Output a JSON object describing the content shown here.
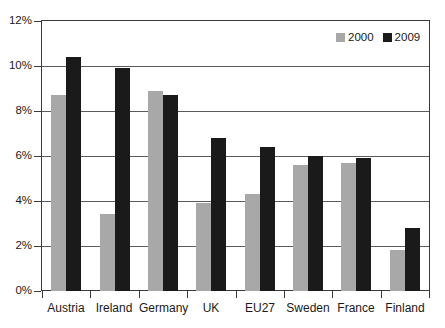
{
  "chart_data": {
    "type": "bar",
    "title": "",
    "xlabel": "",
    "ylabel": "",
    "categories": [
      "Austria",
      "Ireland",
      "Germany",
      "UK",
      "EU27",
      "Sweden",
      "France",
      "Finland"
    ],
    "series": [
      {
        "name": "2000",
        "color": "#a8a8a8",
        "values": [
          8.7,
          3.4,
          8.9,
          3.9,
          4.3,
          5.6,
          5.7,
          1.8
        ]
      },
      {
        "name": "2009",
        "color": "#1a1a1a",
        "values": [
          10.4,
          9.9,
          8.7,
          6.8,
          6.4,
          6.0,
          5.9,
          2.8
        ]
      }
    ],
    "ylim": [
      0,
      12
    ],
    "ytick_values": [
      0,
      2,
      4,
      6,
      8,
      10,
      12
    ],
    "ytick_labels": [
      "0%",
      "2%",
      "4%",
      "6%",
      "8%",
      "10%",
      "12%"
    ],
    "grid": true,
    "grid_axis": "y",
    "legend_position": "top-right",
    "value_suffix": "%"
  }
}
